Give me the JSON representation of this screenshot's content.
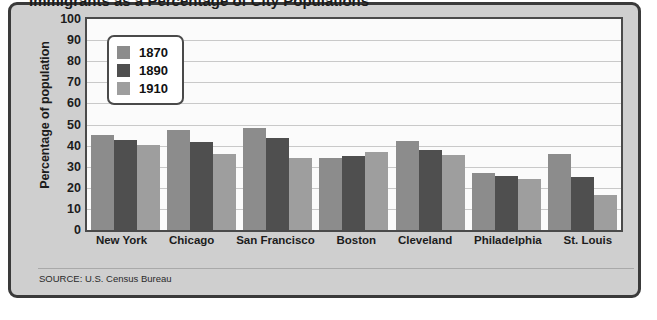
{
  "chart_data": {
    "type": "bar",
    "title": "Immigrants as a Percentage of City Populations",
    "subtitle": "",
    "xlabel": "",
    "ylabel": "Percentage of population",
    "ylim": [
      0,
      100
    ],
    "ytick_step": 10,
    "yticks": [
      100,
      90,
      80,
      70,
      60,
      50,
      40,
      30,
      20,
      10,
      0
    ],
    "grid": true,
    "legend_position": "top-left",
    "categories": [
      "New York",
      "Chicago",
      "San Francisco",
      "Boston",
      "Cleveland",
      "Philadelphia",
      "St. Louis"
    ],
    "series": [
      {
        "name": "1870",
        "color": "#8c8c8c",
        "values": [
          45,
          47.5,
          48.5,
          34,
          42,
          27,
          36
        ]
      },
      {
        "name": "1890",
        "color": "#4f4f4f",
        "values": [
          42.5,
          41.5,
          43.5,
          35,
          38,
          25.5,
          25
        ]
      },
      {
        "name": "1910",
        "color": "#9e9e9e",
        "values": [
          40.5,
          36,
          34,
          37,
          35.5,
          24,
          16.5
        ]
      }
    ],
    "source_note": "SOURCE: U.S. Census Bureau"
  },
  "colors": {
    "panel_background": "#cfcfcf",
    "panel_border": "#3a3a3a",
    "plot_background": "#fbfbfb",
    "plot_border": "#4a4a4a",
    "gridline": "#c9c9c9",
    "text": "#1c1c1c"
  }
}
